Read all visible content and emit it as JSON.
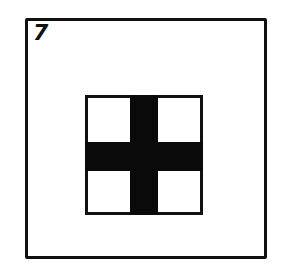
{
  "figure": {
    "number": "7",
    "colors": {
      "stroke": "#111111",
      "cross_fill": "#0a0a0a",
      "background": "#ffffff"
    }
  }
}
